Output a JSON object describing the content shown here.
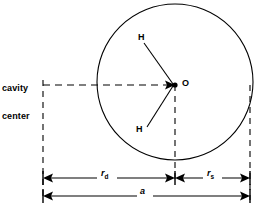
{
  "figure": {
    "background_color": "#ffffff",
    "stroke_color": "#000000",
    "width": 257,
    "height": 208
  },
  "labels": {
    "cavity_center_line1": "cavity",
    "cavity_center_line2": "center",
    "hydrogen_top": "H",
    "hydrogen_bottom": "H",
    "oxygen": "O",
    "r_d_symbol": "r",
    "r_d_subscript": "d",
    "r_s_symbol": "r",
    "r_s_subscript": "s",
    "a_symbol": "a"
  },
  "geometry": {
    "circle": {
      "cx": 175,
      "cy": 82,
      "r": 78
    },
    "oxygen_point": {
      "x": 175,
      "y": 85
    },
    "hydrogen_top_point": {
      "x": 144,
      "y": 43
    },
    "hydrogen_bottom_point": {
      "x": 147,
      "y": 124
    },
    "cavity_center_point": {
      "x": 43,
      "y": 85
    },
    "dimension_row_rd_rs_y": 178,
    "dimension_row_a_y": 196,
    "left_extent_x": 43,
    "center_extent_x": 175,
    "right_extent_x": 250
  },
  "icons": {
    "oxygen_marker": "filled-dot",
    "arrow_marker": "arrowhead"
  }
}
